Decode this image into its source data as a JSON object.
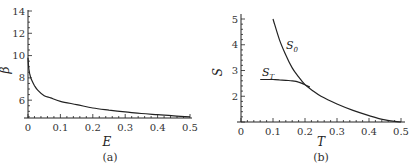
{
  "chart_data": [
    {
      "type": "line",
      "panel": "(a)",
      "title": "",
      "xlabel": "E",
      "ylabel": "β",
      "xlim": [
        0,
        0.5
      ],
      "ylim": [
        4.4,
        14
      ],
      "xticks": [
        "0",
        "0.1",
        "0.2",
        "0.3",
        "0.4",
        "0.5"
      ],
      "yticks": [
        "6",
        "8",
        "10",
        "12",
        "14"
      ],
      "grid": false,
      "series": [
        {
          "name": "β(E)",
          "x": [
            0.0,
            0.002,
            0.005,
            0.01,
            0.02,
            0.03,
            0.05,
            0.07,
            0.1,
            0.15,
            0.2,
            0.25,
            0.3,
            0.35,
            0.4,
            0.45,
            0.5
          ],
          "y": [
            9.8,
            9.0,
            8.4,
            7.9,
            7.3,
            6.9,
            6.4,
            6.2,
            5.9,
            5.6,
            5.3,
            5.1,
            4.95,
            4.8,
            4.7,
            4.6,
            4.5
          ]
        }
      ]
    },
    {
      "type": "line",
      "panel": "(b)",
      "title": "",
      "xlabel": "T",
      "ylabel": "S",
      "xlim": [
        0,
        0.5
      ],
      "ylim": [
        1,
        5
      ],
      "xticks": [
        "0",
        "0.1",
        "0.2",
        "0.3",
        "0.4",
        "0.5"
      ],
      "yticks": [
        "2",
        "3",
        "4",
        "5"
      ],
      "grid": false,
      "series": [
        {
          "name": "S_0",
          "x": [
            0.1,
            0.12,
            0.14,
            0.16,
            0.18,
            0.2,
            0.22,
            0.25,
            0.3,
            0.35,
            0.4,
            0.45,
            0.5
          ],
          "y": [
            5.0,
            4.2,
            3.6,
            3.1,
            2.75,
            2.45,
            2.25,
            2.0,
            1.7,
            1.45,
            1.25,
            1.08,
            1.0
          ]
        },
        {
          "name": "S_T",
          "x": [
            0.06,
            0.08,
            0.1,
            0.12,
            0.14,
            0.16,
            0.18,
            0.2,
            0.215
          ],
          "y": [
            2.65,
            2.65,
            2.65,
            2.64,
            2.62,
            2.6,
            2.55,
            2.45,
            2.35
          ]
        }
      ]
    }
  ],
  "panels": {
    "a": {
      "caption": "(a)",
      "xlabel": "E",
      "ylabel": "β",
      "xticks": [
        "0",
        "0.1",
        "0.2",
        "0.3",
        "0.4",
        "0.5"
      ],
      "yticks": [
        "6",
        "8",
        "10",
        "12",
        "14"
      ]
    },
    "b": {
      "caption": "(b)",
      "xlabel": "T",
      "ylabel": "S",
      "xticks": [
        "0",
        "0.1",
        "0.2",
        "0.3",
        "0.4",
        "0.5"
      ],
      "yticks": [
        "2",
        "3",
        "4",
        "5"
      ],
      "label_s0": "S",
      "label_s0_sub": "0",
      "label_st": "S",
      "label_st_sub": "T"
    }
  }
}
